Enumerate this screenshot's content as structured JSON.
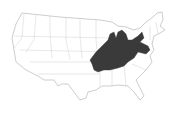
{
  "map": {
    "type": "range-map",
    "region": "Contiguous United States",
    "highlighted_region_description": "Central-eastern US: Ohio River Valley and Appalachian region",
    "colors": {
      "background": "#ffffff",
      "state_fill": "#ffffff",
      "state_border": "#9a9a9a",
      "highlight_fill": "#3a3a3a"
    }
  }
}
